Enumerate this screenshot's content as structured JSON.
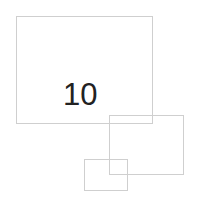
{
  "shapes": [
    {
      "id": "rect-large",
      "type": "rectangle",
      "stroke": "#cfcfcf"
    },
    {
      "id": "rect-medium",
      "type": "rectangle",
      "stroke": "#cfcfcf"
    },
    {
      "id": "rect-small",
      "type": "rectangle",
      "stroke": "#cfcfcf"
    }
  ],
  "label": {
    "text": "10",
    "color": "#222222"
  }
}
